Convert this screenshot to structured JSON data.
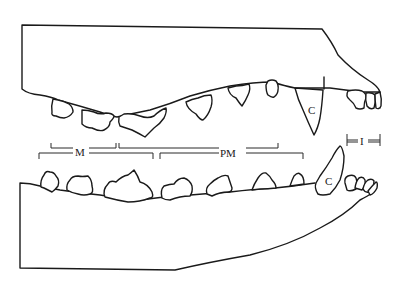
{
  "diagram": {
    "colors": {
      "line": "#1a1a1a",
      "background": "#ffffff"
    },
    "labels": {
      "molars": "M",
      "premolars": "PM",
      "upper_canine": "C",
      "lower_canine": "C",
      "incisors": "I"
    },
    "upper_jaw": {
      "molars_count": 2,
      "premolars_count": 4,
      "canine_count": 1,
      "incisors_count": 3
    },
    "lower_jaw": {
      "molars_count": 3,
      "premolars_count": 4,
      "canine_count": 1,
      "incisors_count": 3
    }
  }
}
